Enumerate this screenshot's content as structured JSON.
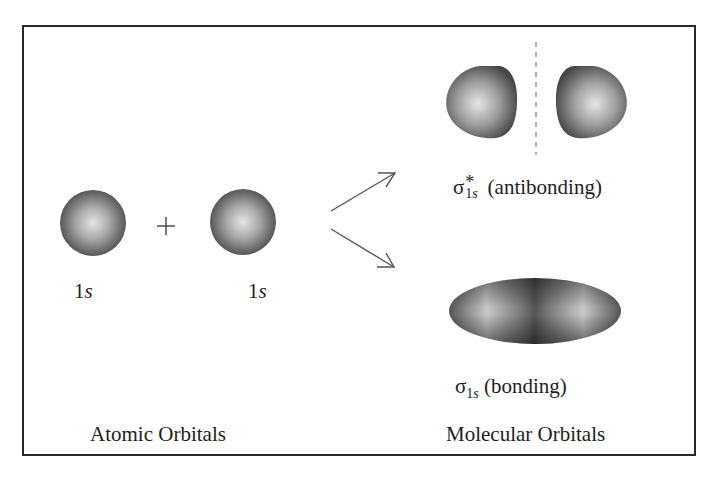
{
  "figure": {
    "type": "molecular-orbital-diagram",
    "operator": "+",
    "atomic": {
      "orbitals": [
        {
          "label_num": "1",
          "label_sym": "s"
        },
        {
          "label_num": "1",
          "label_sym": "s"
        }
      ],
      "caption": "Atomic Orbitals"
    },
    "molecular": {
      "antibonding": {
        "symbol": "σ",
        "superscript": "*",
        "subscript_num": "1",
        "subscript_sym": "s",
        "description": "(antibonding)"
      },
      "bonding": {
        "symbol": "σ",
        "subscript_num": "1",
        "subscript_sym": "s",
        "description": "(bonding)"
      },
      "caption": "Molecular Orbitals"
    }
  },
  "colors": {
    "border": "#2a2a2a",
    "orbital_dark": "#4a4a4a",
    "orbital_light": "#e8e8e8",
    "arrow": "#555555",
    "node_line": "#666666"
  }
}
